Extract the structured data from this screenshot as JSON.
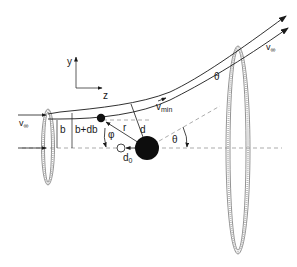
{
  "diagram": {
    "type": "scattering-geometry",
    "axes": {
      "y_label": "y",
      "z_label": "z"
    },
    "labels": {
      "v_inf_in": "v",
      "v_inf_in_sub": "∞",
      "v_inf_out": "v",
      "v_inf_out_sub": "∞",
      "b": "b",
      "b_db": "b+db",
      "r": "r",
      "d": "d",
      "d0": "d",
      "d0_sub": "0",
      "phi": "φ",
      "theta_top": "θ",
      "theta_bottom": "θ",
      "v_min": "v",
      "v_min_sub": "min"
    },
    "elements": [
      "incoming-velocity-arrows",
      "entry-annulus-ring",
      "exit-annulus-ring",
      "scattering-center",
      "particle",
      "initial-position-marker",
      "trajectory-pair",
      "symmetry-axis-dashed"
    ],
    "colors": {
      "ink": "#1a1a1a",
      "dash": "#888888",
      "ring": "#9a9a9a"
    }
  }
}
